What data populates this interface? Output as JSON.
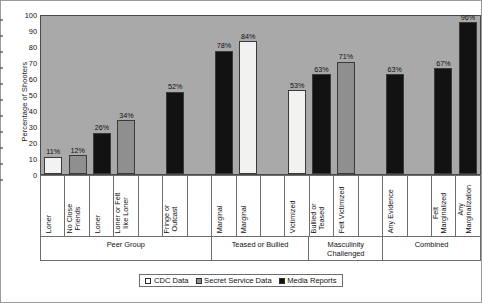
{
  "chart_data": {
    "type": "bar",
    "title": "",
    "xlabel": "",
    "ylabel": "Percentage of Shooters",
    "ylim": [
      0,
      100
    ],
    "yticks": [
      0,
      10,
      20,
      30,
      40,
      50,
      60,
      70,
      80,
      90,
      100
    ],
    "grid": false,
    "legend_position": "bottom-center",
    "plot_background": "#a9a9a9",
    "series": [
      {
        "name": "CDC Data",
        "color": "#ffffff"
      },
      {
        "name": "Secret Service Data",
        "color": "#8f8f8f"
      },
      {
        "name": "Media Reports",
        "color": "#121212"
      }
    ],
    "categories": [
      "Loner",
      "No Close Friends",
      "Loner",
      "Loner or Felt like Loner",
      "",
      "Fringe or Outcast",
      "",
      "Marginal",
      "Marginal",
      "",
      "Victimized",
      "Bullied or Teased",
      "Felt Victimized",
      "",
      "Any Evidence",
      "",
      "Felt Marginalized",
      "Any Marginalization"
    ],
    "values": [
      11,
      12,
      26,
      34,
      null,
      52,
      null,
      78,
      84,
      null,
      53,
      63,
      71,
      null,
      63,
      null,
      67,
      96
    ],
    "value_labels": [
      "11%",
      "12%",
      "26%",
      "34%",
      "",
      "52%",
      "",
      "78%",
      "84%",
      "",
      "53%",
      "63%",
      "71%",
      "",
      "63%",
      "",
      "67%",
      "96%"
    ],
    "bar_series": [
      "CDC Data",
      "Secret Service Data",
      "Media Reports",
      "Secret Service Data",
      null,
      "Media Reports",
      null,
      "Media Reports",
      "CDC Data",
      null,
      "CDC Data",
      "Media Reports",
      "Secret Service Data",
      null,
      "Media Reports",
      null,
      "Media Reports",
      "Media Reports"
    ],
    "groups": [
      {
        "label": "Peer Group",
        "span": 7
      },
      {
        "label": "Teased or Bullied",
        "span": 4
      },
      {
        "label": "Masculinity Challenged",
        "span": 3
      },
      {
        "label": "Combined",
        "span": 4
      }
    ]
  },
  "legend": {
    "items": [
      {
        "label": "CDC Data",
        "swatch": "cdc"
      },
      {
        "label": "Secret Service Data",
        "swatch": "ss"
      },
      {
        "label": "Media Reports",
        "swatch": "media"
      }
    ]
  }
}
